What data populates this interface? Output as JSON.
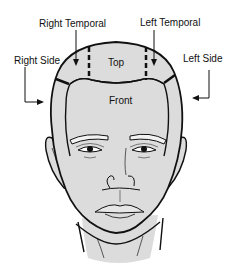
{
  "diagram": {
    "labels": {
      "right_temporal": "Right Temporal",
      "left_temporal": "Left Temporal",
      "right_side": "Right Side",
      "left_side": "Left Side",
      "top": "Top",
      "front": "Front"
    },
    "colors": {
      "skin_fill": "#dcdcdc",
      "outline": "#111111",
      "background": "#ffffff"
    }
  }
}
